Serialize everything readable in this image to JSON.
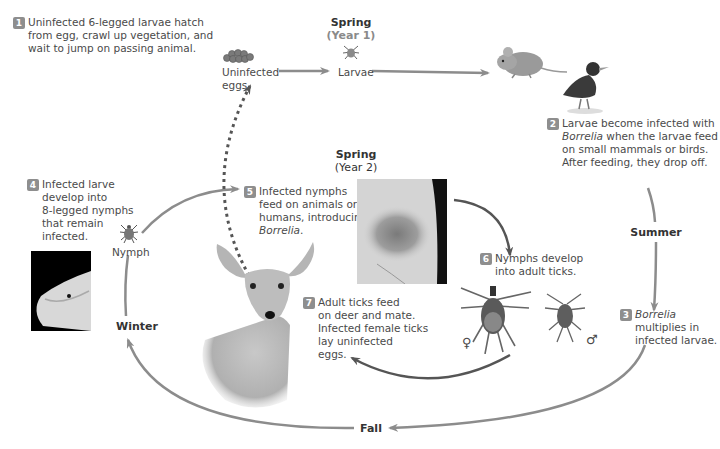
{
  "steps": [
    {
      "n": "1",
      "lines": [
        "Uninfected 6-legged larvae hatch",
        "from egg, crawl up vegetation, and",
        "wait to jump on passing animal."
      ]
    },
    {
      "n": "2",
      "line1_italic": "",
      "line1": "Larvae become infected with",
      "line2_italic": "Borrelia",
      "line2_rest": " when the larvae feed",
      "line3": "on small mammals or birds.",
      "line4": "After feeding, they drop off."
    },
    {
      "n": "3",
      "italic": "Borrelia",
      "lines": [
        "multiplies in",
        "infected larvae."
      ]
    },
    {
      "n": "4",
      "lines": [
        "Infected larve",
        "develop into",
        "8-legged nymphs",
        "that remain",
        "infected."
      ]
    },
    {
      "n": "5",
      "lines": [
        "Infected nymphs",
        "feed on animals or",
        "humans, introducing"
      ],
      "italic": "Borrelia",
      "tail": "."
    },
    {
      "n": "6",
      "lines": [
        "Nymphs develop",
        "into adult ticks."
      ]
    },
    {
      "n": "7",
      "lines": [
        "Adult ticks feed",
        "on deer and mate.",
        "Infected female ticks",
        "lay uninfected",
        "eggs."
      ]
    }
  ],
  "seasons": {
    "spring1": {
      "label": "Spring",
      "sub": "(Year 1)"
    },
    "spring2": {
      "label": "Spring",
      "sub": "(Year 2)"
    },
    "summer": "Summer",
    "fall": "Fall",
    "winter": "Winter"
  },
  "labels": {
    "eggs_line1": "Uninfected",
    "eggs_line2": "eggs",
    "larvae": "Larvae",
    "nymph": "Nymph",
    "female_symbol": "♀",
    "male_symbol": "♂"
  },
  "icons": [
    "egg-cluster-icon",
    "larva-tick-icon",
    "mouse-icon",
    "bird-icon",
    "nymph-tick-icon",
    "deer-illustration",
    "rash-photo",
    "finger-tick-photo",
    "female-adult-tick-icon",
    "male-adult-tick-icon"
  ],
  "colors": {
    "arrow": "#8c8c8c",
    "dark_arrow": "#555555",
    "badge": "#8e8e8e"
  }
}
